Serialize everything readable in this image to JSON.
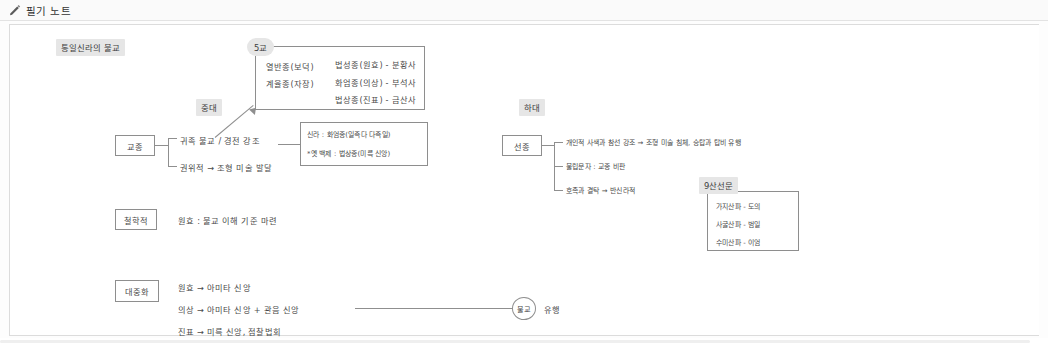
{
  "header": {
    "title": "필기 노트",
    "pencil_icon": "pencil-icon"
  },
  "note": {
    "title": "통일신라의 불교",
    "sections": {
      "schools_box": {
        "badge": "5교",
        "left_col": [
          "열반종(보덕)",
          "계율종(자장)"
        ],
        "right_col": [
          "법성종(원효) - 분황사",
          "화엄종(의상) - 부석사",
          "법상종(진표) - 금산사"
        ]
      },
      "middle_period": {
        "badge": "중대",
        "box_label": "교종",
        "lines": [
          "귀족 불교 / 경전 강조",
          "권위적 → 조형 미술 발달"
        ],
        "side_box": [
          "신라 : 화엄종(일즉다 다즉일)",
          "*옛 백제 : 법상종(미륵 신앙)"
        ]
      },
      "late_period": {
        "badge": "하대",
        "box_label": "선종",
        "lines": [
          "개인적 사색과 참선 강조 → 조형 미술 침체, 승탑과 탑비 유행",
          "불립문자 : 교종 비판",
          "호족과 결탁 → 반신라적"
        ],
        "nine_schools": {
          "badge": "9산선문",
          "items": [
            "가지산파 - 도의",
            "사굴산파 - 범일",
            "수미산파 - 이엄"
          ]
        }
      },
      "philosophy": {
        "box_label": "철학적",
        "lines": [
          "원효 : 불교 이해 기준 마련"
        ]
      },
      "popularization": {
        "box_label": "대중화",
        "lines": [
          "원효 → 아미타 신앙",
          "의상 → 아미타 신앙 + 관음 신앙",
          "진표 → 미륵 신앙, 점찰법회"
        ],
        "result_circle": "불교",
        "result_label": "유행"
      }
    }
  },
  "colors": {
    "ink": "#4a4a4a",
    "line": "#8f8f8f",
    "marker": "#e6e6e6",
    "border": "#dcdcdc"
  }
}
